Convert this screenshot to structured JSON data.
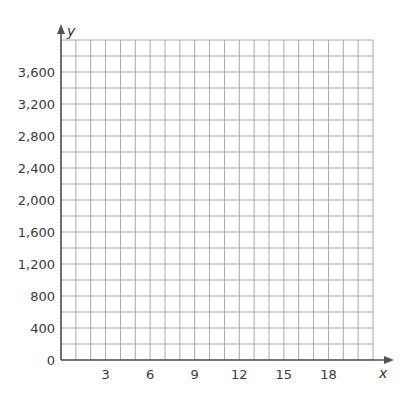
{
  "chart_data": {
    "type": "line",
    "title": "",
    "xlabel": "x",
    "ylabel": "y",
    "xlim": [
      0,
      21
    ],
    "ylim": [
      0,
      4000
    ],
    "grid": true,
    "x_grid_step": 1,
    "y_grid_step": 200,
    "x_ticks": [
      3,
      6,
      9,
      12,
      15,
      18
    ],
    "x_tick_labels": [
      "3",
      "6",
      "9",
      "12",
      "15",
      "18"
    ],
    "y_ticks": [
      0,
      400,
      800,
      1200,
      1600,
      2000,
      2400,
      2800,
      3200,
      3600
    ],
    "y_tick_labels": [
      "0",
      "400",
      "800",
      "1,200",
      "1,600",
      "2,000",
      "2,400",
      "2,800",
      "3,200",
      "3,600"
    ],
    "series": [],
    "legend": null
  },
  "colors": {
    "grid": "#a8a8a8",
    "axis": "#555555",
    "text": "#3a3a3a"
  }
}
